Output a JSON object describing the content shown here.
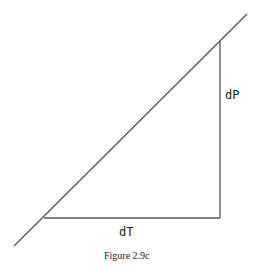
{
  "figure": {
    "caption": "Figure 2.9c",
    "labels": {
      "vertical_leg": "dP",
      "horizontal_leg": "dT"
    },
    "line_color": "#555555"
  }
}
